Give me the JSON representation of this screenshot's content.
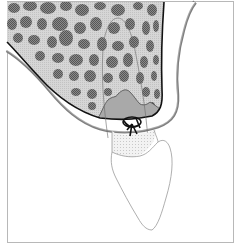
{
  "figure": {
    "type": "anatomical illustration",
    "labels": [],
    "colors": {
      "background": "#ffffff",
      "frame": "#b8b8b8",
      "bone_matrix": "#cfcfcf",
      "trabecular_blobs": "#6e6e6e",
      "cortical_line": "#111111",
      "mucosa_band": "#8a8a8a",
      "socket_fill": "#a9a9a9",
      "crown_stipple": "#e4e4e4",
      "tooth_outline": "#9a9a9a",
      "suture": "#111111"
    },
    "elements": [
      {
        "name": "frame"
      },
      {
        "name": "alveolar-bone"
      },
      {
        "name": "cortical-plate"
      },
      {
        "name": "soft-tissue"
      },
      {
        "name": "mucosa-layer"
      },
      {
        "name": "extraction-socket"
      },
      {
        "name": "root-outline"
      },
      {
        "name": "tooth-crown"
      },
      {
        "name": "suture-knot"
      }
    ]
  }
}
